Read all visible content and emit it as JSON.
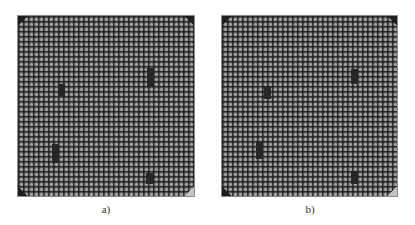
{
  "figure": {
    "panels": [
      {
        "id": "a",
        "caption": "a)",
        "grid": {
          "columns": 35,
          "rows": 36,
          "pitch_px": 5
        },
        "keyouts": [
          {
            "x": 40,
            "y": 68,
            "w": 7,
            "h": 13
          },
          {
            "x": 129,
            "y": 52,
            "w": 7,
            "h": 18
          },
          {
            "x": 34,
            "y": 128,
            "w": 7,
            "h": 19
          },
          {
            "x": 128,
            "y": 157,
            "w": 7,
            "h": 11
          }
        ],
        "corner_markers": {
          "top_left": "dark",
          "top_right": "dark",
          "bottom_left": "dark",
          "bottom_right": "light"
        }
      },
      {
        "id": "b",
        "caption": "b)",
        "grid": {
          "columns": 35,
          "rows": 36,
          "pitch_px": 5
        },
        "keyouts": [
          {
            "x": 42,
            "y": 70,
            "w": 7,
            "h": 13
          },
          {
            "x": 129,
            "y": 53,
            "w": 7,
            "h": 15
          },
          {
            "x": 34,
            "y": 126,
            "w": 7,
            "h": 17
          },
          {
            "x": 129,
            "y": 155,
            "w": 7,
            "h": 13
          }
        ],
        "corner_markers": {
          "top_left": "dark",
          "top_right": "dark",
          "bottom_left": "dark",
          "bottom_right": "light"
        }
      }
    ],
    "colors": {
      "background": "#ffffff",
      "chip_body": "#3a3a3a",
      "pin": "#9a9a9a",
      "keyout": "#262626",
      "corner_dark": "#1e1e1e",
      "corner_light": "#c9c9c9"
    }
  }
}
